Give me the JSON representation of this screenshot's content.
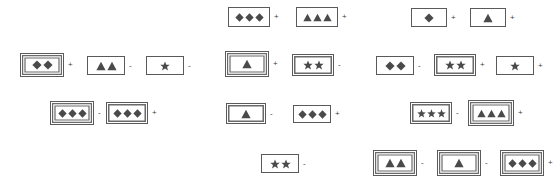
{
  "page": {
    "width": 556,
    "height": 188,
    "background": "#ffffff",
    "shape_color": "#4a4a4a",
    "frame_color": "#5a5a5a",
    "operator_plus": "+",
    "operator_minus": "-"
  },
  "legend": {
    "shape_names": [
      "diamond",
      "triangle",
      "star"
    ],
    "frame_names": [
      "single-border",
      "double-border",
      "triple-border"
    ]
  },
  "items": [
    {
      "id": 1,
      "x": 228,
      "y": 7,
      "w": 42,
      "h": 20,
      "border": 1,
      "shape": "diamond",
      "count": 3,
      "op": "+"
    },
    {
      "id": 2,
      "x": 296,
      "y": 7,
      "w": 42,
      "h": 20,
      "border": 1,
      "shape": "triangle",
      "count": 3,
      "op": "+"
    },
    {
      "id": 3,
      "x": 411,
      "y": 8,
      "w": 36,
      "h": 19,
      "border": 1,
      "shape": "diamond",
      "count": 1,
      "op": "+"
    },
    {
      "id": 4,
      "x": 470,
      "y": 8,
      "w": 36,
      "h": 19,
      "border": 1,
      "shape": "triangle",
      "count": 1,
      "op": "+"
    },
    {
      "id": 5,
      "x": 20,
      "y": 53,
      "w": 44,
      "h": 24,
      "border": 3,
      "shape": "diamond",
      "count": 2,
      "op": "+"
    },
    {
      "id": 6,
      "x": 87,
      "y": 56,
      "w": 38,
      "h": 19,
      "border": 1,
      "shape": "triangle",
      "count": 2,
      "op": "-"
    },
    {
      "id": 7,
      "x": 146,
      "y": 56,
      "w": 38,
      "h": 19,
      "border": 1,
      "shape": "star",
      "count": 1,
      "op": "-"
    },
    {
      "id": 8,
      "x": 225,
      "y": 51,
      "w": 44,
      "h": 26,
      "border": 3,
      "shape": "triangle",
      "count": 1,
      "op": "+"
    },
    {
      "id": 9,
      "x": 292,
      "y": 54,
      "w": 42,
      "h": 22,
      "border": 2,
      "shape": "star",
      "count": 2,
      "op": "-"
    },
    {
      "id": 10,
      "x": 376,
      "y": 56,
      "w": 38,
      "h": 19,
      "border": 1,
      "shape": "diamond",
      "count": 2,
      "op": "-"
    },
    {
      "id": 11,
      "x": 434,
      "y": 54,
      "w": 42,
      "h": 22,
      "border": 2,
      "shape": "star",
      "count": 2,
      "op": "+"
    },
    {
      "id": 12,
      "x": 496,
      "y": 56,
      "w": 38,
      "h": 19,
      "border": 1,
      "shape": "star",
      "count": 1,
      "op": "+"
    },
    {
      "id": 13,
      "x": 50,
      "y": 101,
      "w": 44,
      "h": 24,
      "border": 3,
      "shape": "diamond",
      "count": 3,
      "op": "-"
    },
    {
      "id": 14,
      "x": 106,
      "y": 102,
      "w": 42,
      "h": 22,
      "border": 2,
      "shape": "diamond",
      "count": 3,
      "op": "+"
    },
    {
      "id": 15,
      "x": 226,
      "y": 103,
      "w": 40,
      "h": 21,
      "border": 2,
      "shape": "triangle",
      "count": 1,
      "op": "-"
    },
    {
      "id": 16,
      "x": 293,
      "y": 105,
      "w": 38,
      "h": 18,
      "border": 1,
      "shape": "diamond",
      "count": 3,
      "op": "+"
    },
    {
      "id": 17,
      "x": 410,
      "y": 102,
      "w": 42,
      "h": 22,
      "border": 2,
      "shape": "star",
      "count": 3,
      "op": "-"
    },
    {
      "id": 18,
      "x": 468,
      "y": 100,
      "w": 46,
      "h": 26,
      "border": 3,
      "shape": "triangle",
      "count": 3,
      "op": "+"
    },
    {
      "id": 19,
      "x": 261,
      "y": 154,
      "w": 38,
      "h": 19,
      "border": 1,
      "shape": "star",
      "count": 2,
      "op": "-"
    },
    {
      "id": 20,
      "x": 373,
      "y": 150,
      "w": 44,
      "h": 26,
      "border": 3,
      "shape": "triangle",
      "count": 2,
      "op": "-"
    },
    {
      "id": 21,
      "x": 437,
      "y": 150,
      "w": 44,
      "h": 26,
      "border": 3,
      "shape": "triangle",
      "count": 1,
      "op": "-"
    },
    {
      "id": 22,
      "x": 500,
      "y": 150,
      "w": 44,
      "h": 26,
      "border": 3,
      "shape": "diamond",
      "count": 3,
      "op": "+"
    }
  ]
}
